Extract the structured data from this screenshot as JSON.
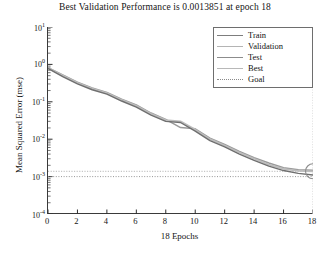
{
  "chart_data": {
    "type": "line",
    "title": "Best Validation Performance is 0.0013851 at epoch 18",
    "xlabel": "18 Epochs",
    "ylabel": "Mean Squared Error (mse)",
    "xlim": [
      0,
      18
    ],
    "ylim": [
      0.0001,
      10
    ],
    "yscale": "log",
    "xscale": "linear",
    "grid": false,
    "legend_position": "upper right",
    "xticks": [
      "0",
      "2",
      "4",
      "6",
      "8",
      "10",
      "12",
      "14",
      "16",
      "18"
    ],
    "xtick_values": [
      0,
      2,
      4,
      6,
      8,
      10,
      12,
      14,
      16,
      18
    ],
    "yticks": [
      "10^1",
      "10^0",
      "10^-1",
      "10^-2",
      "10^-3",
      "10^-4"
    ],
    "ytick_values": [
      10,
      1,
      0.1,
      0.01,
      0.001,
      0.0001
    ],
    "x": [
      0,
      1,
      2,
      3,
      4,
      5,
      6,
      7,
      8,
      9,
      10,
      11,
      12,
      13,
      14,
      15,
      16,
      17,
      18
    ],
    "series": [
      {
        "name": "Train",
        "color": "#7d7d7d",
        "style": "solid",
        "values": [
          0.78,
          0.47,
          0.3,
          0.21,
          0.16,
          0.105,
          0.072,
          0.044,
          0.03,
          0.028,
          0.0165,
          0.0092,
          0.0062,
          0.004,
          0.0027,
          0.0019,
          0.00145,
          0.00122,
          0.0011
        ]
      },
      {
        "name": "Validation",
        "color": "#a8a8a8",
        "style": "solid",
        "values": [
          0.8,
          0.5,
          0.32,
          0.225,
          0.17,
          0.112,
          0.078,
          0.048,
          0.0325,
          0.03,
          0.018,
          0.01,
          0.0068,
          0.0044,
          0.003,
          0.0021,
          0.0016,
          0.00142,
          0.0013851
        ]
      },
      {
        "name": "Test",
        "color": "#909090",
        "style": "solid",
        "values": [
          0.82,
          0.52,
          0.335,
          0.235,
          0.178,
          0.118,
          0.082,
          0.05,
          0.034,
          0.0205,
          0.019,
          0.0106,
          0.0072,
          0.0047,
          0.0032,
          0.0023,
          0.00172,
          0.00152,
          0.00148
        ]
      }
    ],
    "best_marker": {
      "label": "Best",
      "epoch": 18,
      "value": 0.0013851,
      "color": "#999999",
      "style": "dashed"
    },
    "goal_line": {
      "label": "Goal",
      "value": 0.001,
      "color": "#8a8a8a",
      "style": "dotted"
    },
    "legend": [
      {
        "label": "Train",
        "color": "#7d7d7d",
        "style": "solid"
      },
      {
        "label": "Validation",
        "color": "#b4b4b4",
        "style": "solid"
      },
      {
        "label": "Test",
        "color": "#8c8c8c",
        "style": "solid"
      },
      {
        "label": "Best",
        "color": "#b8b8b8",
        "style": "solid"
      },
      {
        "label": "Goal",
        "color": "#8a8a8a",
        "style": "dotted"
      }
    ]
  }
}
